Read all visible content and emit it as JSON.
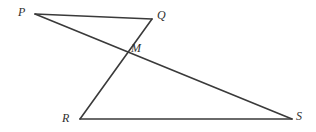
{
  "figure": {
    "background_color": "#ffffff",
    "stroke_color": "#3a3a3a",
    "label_color": "#2f2f2f",
    "stroke_width": 1.6,
    "width": 316,
    "height": 132
  },
  "points": {
    "P": {
      "label": "P",
      "x": 35,
      "y": 14,
      "label_x": 18,
      "label_y": 6
    },
    "Q": {
      "label": "Q",
      "x": 152,
      "y": 19,
      "label_x": 157,
      "label_y": 9
    },
    "M": {
      "label": "M",
      "x": 125,
      "y": 51,
      "label_x": 131,
      "label_y": 42
    },
    "R": {
      "label": "R",
      "x": 80,
      "y": 119,
      "label_x": 62,
      "label_y": 112
    },
    "S": {
      "label": "S",
      "x": 292,
      "y": 119,
      "label_x": 296,
      "label_y": 110
    }
  },
  "segments": [
    {
      "name": "segment-PQ",
      "from": "P",
      "to": "Q",
      "x1": 35,
      "y1": 14,
      "x2": 152,
      "y2": 19
    },
    {
      "name": "segment-PS",
      "from": "P",
      "to": "S",
      "x1": 35,
      "y1": 14,
      "x2": 292,
      "y2": 119
    },
    {
      "name": "segment-QR",
      "from": "Q",
      "to": "R",
      "x1": 152,
      "y1": 19,
      "x2": 80,
      "y2": 119
    },
    {
      "name": "segment-RS",
      "from": "R",
      "to": "S",
      "x1": 80,
      "y1": 119,
      "x2": 292,
      "y2": 119
    }
  ],
  "chart_data": {
    "type": "diagram",
    "vertices": [
      {
        "id": "P",
        "x": 35,
        "y": 14
      },
      {
        "id": "Q",
        "x": 152,
        "y": 19
      },
      {
        "id": "M",
        "x": 125,
        "y": 51
      },
      {
        "id": "R",
        "x": 80,
        "y": 119
      },
      {
        "id": "S",
        "x": 292,
        "y": 119
      }
    ],
    "edges": [
      [
        "P",
        "Q"
      ],
      [
        "P",
        "S"
      ],
      [
        "Q",
        "R"
      ],
      [
        "R",
        "S"
      ]
    ],
    "intersection": {
      "id": "M",
      "of": [
        [
          "P",
          "S"
        ],
        [
          "Q",
          "R"
        ]
      ],
      "x": 125,
      "y": 51
    },
    "labels": [
      "P",
      "Q",
      "M",
      "R",
      "S"
    ]
  }
}
